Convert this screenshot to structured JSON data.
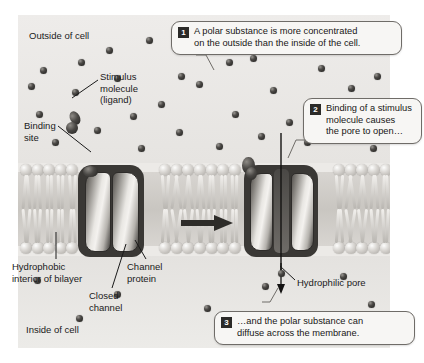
{
  "figure": {
    "background_color": "#eceae7",
    "accent_color": "#2b2a28"
  },
  "regions": {
    "outside_label": "Outside of cell",
    "inside_label": "Inside of cell"
  },
  "labels": {
    "stimulus": "Stimulus\nmolecule\n(ligand)",
    "binding_site": "Binding\nsite",
    "hydrophobic": "Hydrophobic\ninterior of bilayer",
    "channel_protein": "Channel\nprotein",
    "closed_channel": "Closed\nchannel",
    "hydrophilic_pore": "Hydrophilic pore"
  },
  "callouts": [
    {
      "number": "1",
      "text": "A polar substance is more concentrated\non the outside than the inside of the cell."
    },
    {
      "number": "2",
      "text": "Binding of a stimulus\nmolecule causes\nthe pore to open…"
    },
    {
      "number": "3",
      "text": "…and the polar substance can\ndiffuse across the membrane."
    }
  ],
  "states": {
    "left_state": "closed",
    "right_state": "open"
  },
  "icons": {
    "transition_arrow": "arrow-right-icon",
    "diffusion_arrow": "arrow-down-icon"
  }
}
